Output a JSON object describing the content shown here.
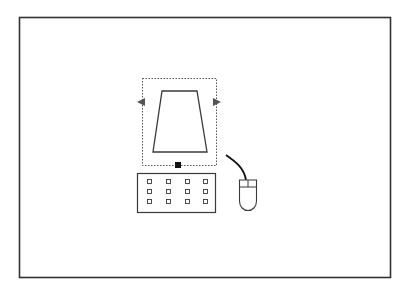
{
  "diagram": {
    "title": "",
    "colors": {
      "background": "#ffffff",
      "frame": "#333333",
      "stroke": "#3a3a3a",
      "selection": "#555555",
      "handle": "#111111",
      "arrow": "#555555"
    },
    "elements": [
      {
        "id": "frame",
        "label": "frame"
      },
      {
        "id": "monitor",
        "label": "monitor",
        "selected": true
      },
      {
        "id": "keyboard",
        "label": "keyboard",
        "keys_rows": 3,
        "keys_cols": 4
      },
      {
        "id": "mouse",
        "label": "mouse"
      }
    ]
  }
}
